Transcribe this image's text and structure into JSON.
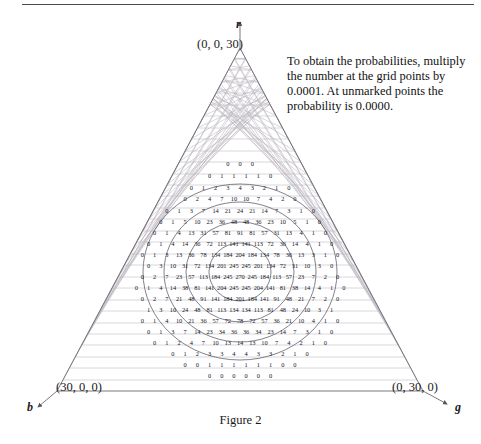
{
  "figure": {
    "caption": "Figure 2",
    "apex_coordinate": "(0, 0, 30)",
    "left_coordinate": "(30, 0, 0)",
    "right_coordinate": "(0, 30, 0)",
    "axis_labels": {
      "top": "r",
      "left": "b",
      "right": "g"
    },
    "note": "To obtain the probabilities, multiply the number at the grid points by 0.0001. At unmarked points the probability is 0.0000."
  },
  "colors": {
    "grid_line": "#b9b4bd",
    "triangle_outline": "#6e6a72",
    "contour": "#5b5763",
    "number": "#14141e",
    "rule": "#4a4a4a",
    "text": "#111111"
  },
  "chart_data": {
    "type": "heatmap",
    "title": "Figure 2",
    "xlabel": "b",
    "ylabel": "r",
    "zlabel": "g",
    "grid": "triangular barycentric lattice, side n = 30",
    "scale_factor": 0.0001,
    "annotation": "To obtain the probabilities, multiply the number at the grid points by 0.0001. At unmarked points the probability is 0.0000.",
    "corners": {
      "top": {
        "label": "r",
        "value": "(0, 0, 30)"
      },
      "bottom_left": {
        "label": "b",
        "value": "(30, 0, 0)"
      },
      "bottom_right": {
        "label": "g",
        "value": "(0, 30, 0)"
      }
    },
    "legend": "none",
    "grid_on": true,
    "rows": [
      {
        "row": 1,
        "values": [
          0,
          0,
          0
        ]
      },
      {
        "row": 2,
        "values": [
          0,
          1,
          1,
          1,
          1,
          0
        ]
      },
      {
        "row": 3,
        "values": [
          0,
          1,
          2,
          3,
          4,
          3,
          2,
          1,
          0
        ]
      },
      {
        "row": 4,
        "values": [
          0,
          2,
          4,
          7,
          10,
          10,
          7,
          4,
          2,
          0
        ]
      },
      {
        "row": 5,
        "values": [
          0,
          1,
          3,
          7,
          14,
          21,
          24,
          21,
          14,
          7,
          3,
          1,
          0
        ]
      },
      {
        "row": 6,
        "values": [
          0,
          1,
          5,
          10,
          23,
          36,
          48,
          48,
          36,
          23,
          10,
          5,
          1,
          0
        ]
      },
      {
        "row": 7,
        "values": [
          0,
          1,
          4,
          13,
          31,
          57,
          81,
          91,
          81,
          57,
          31,
          13,
          4,
          1,
          0
        ]
      },
      {
        "row": 8,
        "values": [
          0,
          1,
          4,
          14,
          36,
          72,
          113,
          141,
          141,
          113,
          72,
          36,
          14,
          4,
          1,
          0
        ]
      },
      {
        "row": 9,
        "values": [
          0,
          1,
          3,
          13,
          36,
          78,
          134,
          184,
          204,
          184,
          134,
          78,
          36,
          13,
          3,
          1,
          0
        ]
      },
      {
        "row": 10,
        "values": [
          0,
          3,
          10,
          31,
          72,
          134,
          201,
          245,
          245,
          201,
          134,
          72,
          31,
          10,
          3,
          0
        ]
      },
      {
        "row": 11,
        "values": [
          0,
          2,
          7,
          23,
          57,
          113,
          184,
          245,
          270,
          245,
          184,
          113,
          57,
          23,
          7,
          2,
          0
        ]
      },
      {
        "row": 12,
        "values": [
          0,
          1,
          4,
          14,
          38,
          81,
          141,
          204,
          245,
          245,
          204,
          141,
          81,
          38,
          14,
          4,
          1,
          0
        ]
      },
      {
        "row": 13,
        "values": [
          0,
          2,
          7,
          21,
          48,
          91,
          141,
          184,
          201,
          184,
          141,
          91,
          48,
          21,
          7,
          2,
          0
        ]
      },
      {
        "row": 14,
        "values": [
          1,
          3,
          10,
          24,
          48,
          81,
          113,
          134,
          134,
          113,
          81,
          48,
          24,
          10,
          3,
          1
        ]
      },
      {
        "row": 15,
        "values": [
          0,
          1,
          4,
          10,
          21,
          36,
          57,
          72,
          78,
          72,
          57,
          36,
          21,
          10,
          4,
          1,
          0
        ]
      },
      {
        "row": 16,
        "values": [
          0,
          1,
          3,
          7,
          14,
          23,
          34,
          36,
          36,
          34,
          23,
          14,
          7,
          3,
          1,
          0
        ]
      },
      {
        "row": 17,
        "values": [
          0,
          1,
          2,
          4,
          7,
          10,
          13,
          14,
          13,
          10,
          7,
          4,
          2,
          1,
          0
        ]
      },
      {
        "row": 18,
        "values": [
          0,
          1,
          2,
          3,
          3,
          4,
          4,
          3,
          3,
          2,
          1,
          0
        ]
      },
      {
        "row": 19,
        "values": [
          0,
          0,
          1,
          1,
          1,
          1,
          1,
          1,
          0,
          0
        ]
      },
      {
        "row": 20,
        "values": [
          0,
          0,
          0,
          0,
          0,
          0
        ]
      }
    ],
    "row_y": [
      163,
      175,
      187,
      198,
      210,
      221,
      232,
      243,
      254,
      265,
      276,
      287,
      298,
      309,
      320,
      331,
      342,
      353,
      364,
      375
    ],
    "contours": [
      {
        "level": "outer",
        "cx": 240,
        "cy": 272,
        "rx": 97,
        "ry": 88
      },
      {
        "level": "mid",
        "cx": 240,
        "cy": 272,
        "rx": 76,
        "ry": 70
      },
      {
        "level": "inner",
        "cx": 240,
        "cy": 272,
        "rx": 54,
        "ry": 50
      },
      {
        "level": "core",
        "cx": 240,
        "cy": 272,
        "rx": 31,
        "ry": 29
      }
    ]
  }
}
